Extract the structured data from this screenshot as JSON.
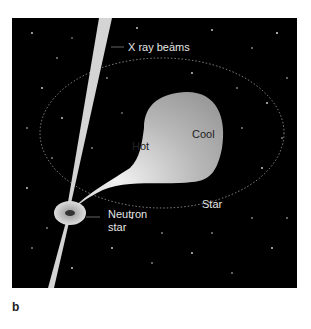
{
  "figure": {
    "panel_label": "b",
    "labels": {
      "xray": "X ray beams",
      "hot": "Hot",
      "cool": "Cool",
      "star": "Star",
      "neutron_line1": "Neutron",
      "neutron_line2": "star"
    },
    "colors": {
      "background": "#000000",
      "star_light": "#d8d8d8",
      "star_dark": "#a0a0a0",
      "orbit": "#bbbbbb",
      "beam": "#cfcfcf"
    }
  }
}
